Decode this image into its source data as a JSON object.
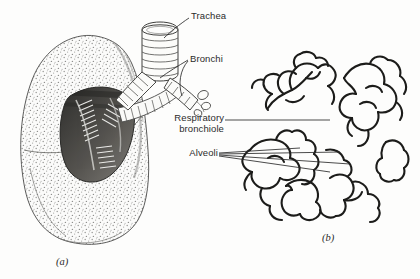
{
  "figure": {
    "background_color": "#fdfdfc",
    "ink_color": "#2b2b2b"
  },
  "labels": [
    {
      "id": "trachea",
      "text": "Trachea",
      "x": 191,
      "y": 11
    },
    {
      "id": "bronchi",
      "text": "Bronchi",
      "x": 190,
      "y": 54
    },
    {
      "id": "respiratory",
      "text": "Respiratory",
      "x": 168,
      "y": 113
    },
    {
      "id": "bronchiole",
      "text": "bronchiole",
      "x": 173,
      "y": 124
    },
    {
      "id": "alveoli",
      "text": "Alveoli",
      "x": 189,
      "y": 150
    }
  ],
  "panels": [
    {
      "id": "panel-a",
      "text": "(a)",
      "x": 56,
      "y": 256,
      "caption": "Cut-away view of lung with trachea and bronchial tree"
    },
    {
      "id": "panel-b",
      "text": "(b)",
      "x": 322,
      "y": 232,
      "caption": "Resin cast of respiratory bronchiole and alveolar clusters"
    }
  ]
}
